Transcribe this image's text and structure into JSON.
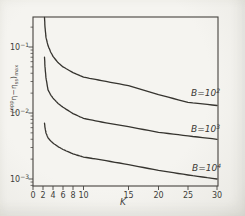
{
  "figure": {
    "background": "#f3f2ee",
    "ink": "#36342f",
    "kind": "scanned journal line plot"
  },
  "chart_data": {
    "type": "line",
    "title": "",
    "xlabel": "K",
    "ylabel": "(ᵃᵖᵖη−ηₛₛ)ₘₐₓ",
    "ylabel_parts": {
      "open": "(",
      "prefix_sup": "app",
      "body": "η−η",
      "body_sub": "ss",
      "close": ")",
      "suffix_sub": "max"
    },
    "grid": false,
    "legend_position": "labels on curves, right side",
    "x_axis": {
      "scale": "linear (hand-drafted, 0–10 region compressed)",
      "min": 0,
      "max": 30,
      "ticks": [
        {
          "label": "0",
          "value": 0
        },
        {
          "label": "2",
          "value": 2
        },
        {
          "label": "4",
          "value": 4
        },
        {
          "label": "6",
          "value": 6
        },
        {
          "label": "8",
          "value": 8
        },
        {
          "label": "10",
          "value": 10
        },
        {
          "label": "15",
          "value": 15
        },
        {
          "label": "20",
          "value": 20
        },
        {
          "label": "25",
          "value": 25
        },
        {
          "label": "30",
          "value": 30
        }
      ]
    },
    "y_axis": {
      "scale": "log",
      "min": 0.001,
      "max": 0.3,
      "ticks": [
        {
          "label": "10⁻¹",
          "base": "10",
          "exp": "−1",
          "value": 0.1
        },
        {
          "label": "10⁻²",
          "base": "10",
          "exp": "−2",
          "value": 0.01
        },
        {
          "label": "10⁻³",
          "base": "10",
          "exp": "−3",
          "value": 0.001
        }
      ]
    },
    "series": [
      {
        "name": "B=1e2",
        "label": "B=10²",
        "label_base": "B=10",
        "label_exp": "2",
        "K": [
          2.3,
          2.4,
          2.6,
          3,
          3.5,
          4,
          5,
          6,
          8,
          10,
          12,
          15,
          20,
          25,
          30
        ],
        "values": [
          0.28,
          0.2,
          0.14,
          0.105,
          0.085,
          0.072,
          0.058,
          0.05,
          0.041,
          0.035,
          0.031,
          0.026,
          0.019,
          0.0145,
          0.013
        ]
      },
      {
        "name": "B=1e3",
        "label": "B=10³",
        "label_base": "B=10",
        "label_exp": "3",
        "K": [
          2.3,
          2.4,
          2.6,
          3,
          3.5,
          4,
          5,
          6,
          8,
          10,
          12,
          15,
          20,
          25,
          30
        ],
        "values": [
          0.07,
          0.05,
          0.034,
          0.0225,
          0.019,
          0.0168,
          0.014,
          0.0122,
          0.0098,
          0.0083,
          0.0073,
          0.0062,
          0.0051,
          0.0045,
          0.004
        ]
      },
      {
        "name": "B=1e4",
        "label": "B=10⁴",
        "label_base": "B=10",
        "label_exp": "4",
        "K": [
          2.3,
          2.4,
          2.6,
          3,
          3.5,
          4,
          5,
          6,
          8,
          10,
          12,
          15,
          20,
          25,
          30
        ],
        "values": [
          0.007,
          0.006,
          0.005,
          0.0042,
          0.0038,
          0.0035,
          0.0031,
          0.0028,
          0.0024,
          0.00215,
          0.00195,
          0.00165,
          0.00135,
          0.00115,
          0.001
        ]
      }
    ]
  }
}
